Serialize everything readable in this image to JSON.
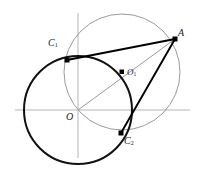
{
  "figure": {
    "colors": {
      "axis": "#b0b0b0",
      "thin_circle": "#9a9a9a",
      "thick_circle": "#111111",
      "thick_line": "#000000",
      "thin_line": "#9a9a9a",
      "point": "#000000",
      "label": "#1a1a1a",
      "background": "#ffffff"
    },
    "axes": {
      "x_axis": {
        "x1": 15,
        "y1": 110,
        "x2": 190,
        "y2": 110
      },
      "y_axis": {
        "x1": 78,
        "y1": 13,
        "x2": 78,
        "y2": 158
      }
    },
    "circles": [
      {
        "name": "circle-O",
        "cx": 78,
        "cy": 110,
        "r": 54,
        "stroke": "#111111",
        "width": 2.0
      },
      {
        "name": "circle-O1",
        "cx": 122,
        "cy": 72,
        "r": 58,
        "stroke": "#9a9a9a",
        "width": 1.0
      }
    ],
    "segments": [
      {
        "name": "segment-A-C1",
        "x1": 175,
        "y1": 39,
        "x2": 67,
        "y2": 60,
        "stroke": "#000000",
        "width": 1.9
      },
      {
        "name": "segment-A-C2",
        "x1": 175,
        "y1": 39,
        "x2": 121,
        "y2": 133,
        "stroke": "#000000",
        "width": 1.9
      },
      {
        "name": "segment-O-A",
        "x1": 78,
        "y1": 110,
        "x2": 175,
        "y2": 39,
        "stroke": "#9a9a9a",
        "width": 1.0
      }
    ],
    "points": [
      {
        "name": "point-A",
        "x": 175,
        "y": 39,
        "label": "A",
        "sub": ""
      },
      {
        "name": "point-C1",
        "x": 67,
        "y": 60,
        "label": "C",
        "sub": "1"
      },
      {
        "name": "point-C2",
        "x": 121,
        "y": 133,
        "label": "C",
        "sub": "2"
      },
      {
        "name": "point-O1",
        "x": 122,
        "y": 72,
        "label": "O",
        "sub": "1"
      }
    ],
    "labels": {
      "A": "A",
      "C1_base": "C",
      "C1_sub": "1",
      "C2_base": "C",
      "C2_sub": "2",
      "O": "O",
      "O1_base": "O",
      "O1_sub": "1"
    }
  }
}
